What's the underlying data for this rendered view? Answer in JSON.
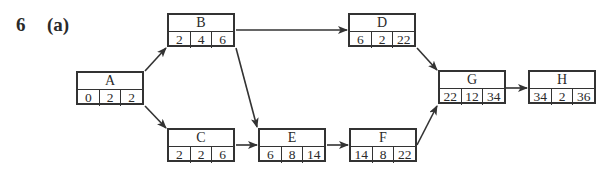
{
  "question": {
    "number": "6",
    "part": "(a)"
  },
  "nodes": {
    "A": {
      "label": "A",
      "values": [
        "0",
        "2",
        "2"
      ]
    },
    "B": {
      "label": "B",
      "values": [
        "2",
        "4",
        "6"
      ]
    },
    "C": {
      "label": "C",
      "values": [
        "2",
        "2",
        "6"
      ]
    },
    "D": {
      "label": "D",
      "values": [
        "6",
        "2",
        "22"
      ]
    },
    "E": {
      "label": "E",
      "values": [
        "6",
        "8",
        "14"
      ]
    },
    "F": {
      "label": "F",
      "values": [
        "14",
        "8",
        "22"
      ]
    },
    "G": {
      "label": "G",
      "values": [
        "22",
        "12",
        "34"
      ]
    },
    "H": {
      "label": "H",
      "values": [
        "34",
        "2",
        "36"
      ]
    }
  },
  "edges": [
    [
      "A",
      "B"
    ],
    [
      "A",
      "C"
    ],
    [
      "B",
      "D"
    ],
    [
      "B",
      "E"
    ],
    [
      "C",
      "E"
    ],
    [
      "E",
      "F"
    ],
    [
      "D",
      "G"
    ],
    [
      "F",
      "G"
    ],
    [
      "G",
      "H"
    ]
  ]
}
